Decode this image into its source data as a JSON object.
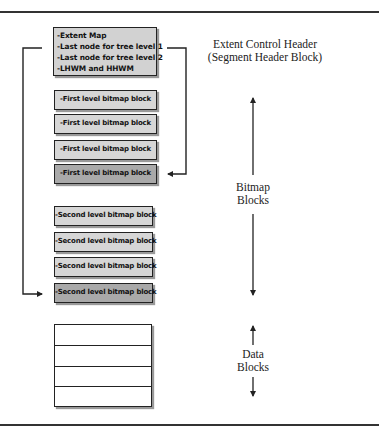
{
  "header_block": {
    "lines": [
      "-Extent Map",
      "-Last node for tree level 1",
      "-Last node for tree level 2",
      "-LHWM and HHWM"
    ]
  },
  "first_level_blocks": [
    {
      "label": "-First level bitmap block",
      "shade": "light"
    },
    {
      "label": "-First level bitmap block",
      "shade": "light"
    },
    {
      "label": "-First level bitmap block",
      "shade": "light"
    },
    {
      "label": "-First level bitmap block",
      "shade": "dark"
    }
  ],
  "second_level_blocks": [
    {
      "label": "-Second level bitmap block",
      "shade": "light"
    },
    {
      "label": "-Second level bitmap block",
      "shade": "light"
    },
    {
      "label": "-Second level bitmap block",
      "shade": "light"
    },
    {
      "label": "-Second level bitmap block",
      "shade": "dark"
    }
  ],
  "data_blocks": {
    "rows": 4
  },
  "labels": {
    "extent_header_line1": "Extent Control Header",
    "extent_header_line2": "(Segment Header Block)",
    "bitmap_line1": "Bitmap",
    "bitmap_line2": "Blocks",
    "data_line1": "Data",
    "data_line2": "Blocks"
  },
  "colors": {
    "light_block": "#d6d6d6",
    "dark_block": "#a9a9a9",
    "header_block": "#d2d2d2",
    "line": "#222222"
  }
}
